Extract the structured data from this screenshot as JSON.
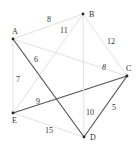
{
  "graph": {
    "nodes": [
      {
        "id": "A",
        "label": "A"
      },
      {
        "id": "B",
        "label": "B"
      },
      {
        "id": "C",
        "label": "C"
      },
      {
        "id": "D",
        "label": "D"
      },
      {
        "id": "E",
        "label": "E"
      }
    ],
    "edges": [
      {
        "from": "A",
        "to": "B",
        "weight": "8",
        "highlighted": false
      },
      {
        "from": "B",
        "to": "E",
        "weight": "11",
        "highlighted": false
      },
      {
        "from": "B",
        "to": "C",
        "weight": "12",
        "highlighted": false
      },
      {
        "from": "A",
        "to": "C",
        "weight": "8",
        "highlighted": false
      },
      {
        "from": "A",
        "to": "D",
        "weight": "6",
        "highlighted": true
      },
      {
        "from": "A",
        "to": "E",
        "weight": "7",
        "highlighted": false
      },
      {
        "from": "E",
        "to": "C",
        "weight": "9",
        "highlighted": true
      },
      {
        "from": "B",
        "to": "D",
        "weight": "10",
        "highlighted": false
      },
      {
        "from": "C",
        "to": "D",
        "weight": "5",
        "highlighted": true
      },
      {
        "from": "E",
        "to": "D",
        "weight": "15",
        "highlighted": false
      }
    ],
    "colors": {
      "highlighted": "#555555",
      "normal": "#e2e2e2",
      "node": "#222222"
    }
  }
}
